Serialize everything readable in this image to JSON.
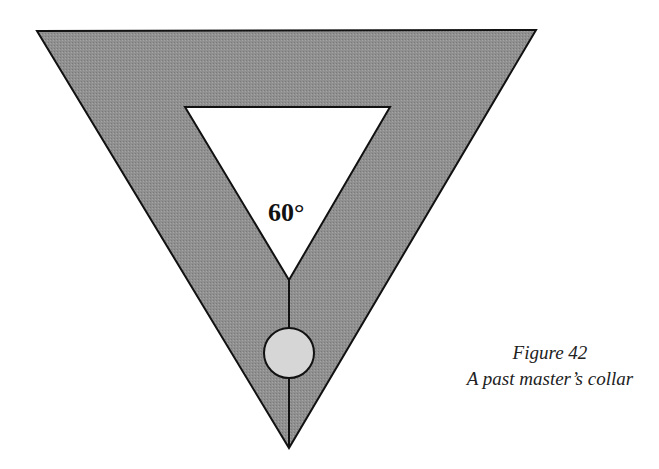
{
  "figure": {
    "angle_label": "60°",
    "caption_title": "Figure 42",
    "caption_subtitle": "A past master’s collar",
    "colors": {
      "collar_fill": "#8e8e8e",
      "jewel_fill": "#d4d4d4",
      "outline": "#111111",
      "background": "#ffffff"
    }
  }
}
